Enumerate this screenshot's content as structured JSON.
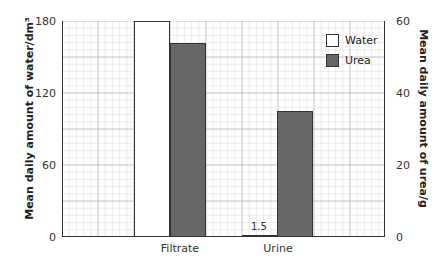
{
  "chart_data": {
    "type": "bar",
    "title": "",
    "categories": [
      "Filtrate",
      "Urine"
    ],
    "series": [
      {
        "name": "Water",
        "axis": "left",
        "unit": "dm³",
        "values": [
          180,
          1.5
        ],
        "color": "#ffffff"
      },
      {
        "name": "Urea",
        "axis": "right",
        "unit": "g",
        "values": [
          54,
          35
        ],
        "color": "#666666"
      }
    ],
    "ylabel_left": "Mean daily amount of water/dm³",
    "ylabel_right": "Mean daily amount of urea/g",
    "ylim_left": [
      0,
      180
    ],
    "ylim_right": [
      0,
      60
    ],
    "yticks_left": [
      "0",
      "60",
      "120",
      "180"
    ],
    "yticks_right": [
      "0",
      "20",
      "40",
      "60"
    ],
    "annotations": [
      {
        "text": "1.5",
        "target": "Urine Water"
      }
    ],
    "grid": true,
    "legend_position": "top-right"
  }
}
